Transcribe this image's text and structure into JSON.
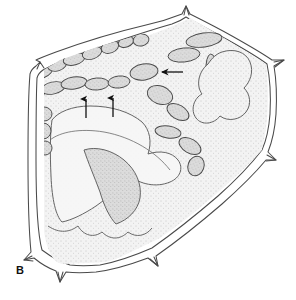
{
  "figure": {
    "panel_label": "B",
    "caption_text": "",
    "background_color": "#ffffff",
    "line_color": "#3a3a3a",
    "cytoplasm_fill": "#efefef",
    "cytoplasm_stipple_color": "#9a9a9a",
    "organelle_fill": "#d4d4d4",
    "organelle_stipple_color": "#8f8f8f",
    "organelle_outline": "#4a4a4a",
    "wall_outline": "#4a4a4a",
    "arrow_color": "#111111"
  },
  "structures": {
    "cell_wall": {
      "name": "cell-wall-outline",
      "style": "double-line",
      "spine_count": 8,
      "description": "Angular polygonal cell wall drawn as two parallel contour lines with sharp spine-like projections at each vertex"
    },
    "cytoplasm": {
      "name": "cytoplasm-region",
      "texture": "fine stipple"
    },
    "vacuole_lobe": {
      "name": "central-lobe",
      "description": "Large pale lobed region occupying lower-central portion of cell"
    }
  },
  "organelles": {
    "label": "chloroplasts",
    "count": 34,
    "fill": "#d4d4d4",
    "shapes": [
      {
        "id": "org-1",
        "cx": 28,
        "cy": 82,
        "rx": 9,
        "ry": 6,
        "rot": -28
      },
      {
        "id": "org-2",
        "cx": 42,
        "cy": 72,
        "rx": 11,
        "ry": 6,
        "rot": -22
      },
      {
        "id": "org-3",
        "cx": 57,
        "cy": 64,
        "rx": 10,
        "ry": 7,
        "rot": -18
      },
      {
        "id": "org-4",
        "cx": 74,
        "cy": 59,
        "rx": 11,
        "ry": 6,
        "rot": -14
      },
      {
        "id": "org-5",
        "cx": 92,
        "cy": 53,
        "rx": 10,
        "ry": 6,
        "rot": -20
      },
      {
        "id": "org-6",
        "cx": 110,
        "cy": 47,
        "rx": 9,
        "ry": 6,
        "rot": -20
      },
      {
        "id": "org-7",
        "cx": 126,
        "cy": 42,
        "rx": 8,
        "ry": 5,
        "rot": -20
      },
      {
        "id": "org-8",
        "cx": 141,
        "cy": 40,
        "rx": 8,
        "ry": 6,
        "rot": -10
      },
      {
        "id": "org-9",
        "cx": 34,
        "cy": 95,
        "rx": 10,
        "ry": 6,
        "rot": -10
      },
      {
        "id": "org-10",
        "cx": 53,
        "cy": 88,
        "rx": 12,
        "ry": 6,
        "rot": -12
      },
      {
        "id": "org-11",
        "cx": 74,
        "cy": 83,
        "rx": 13,
        "ry": 6,
        "rot": -8
      },
      {
        "id": "org-12",
        "cx": 97,
        "cy": 84,
        "rx": 12,
        "ry": 6,
        "rot": -4
      },
      {
        "id": "org-13",
        "cx": 119,
        "cy": 82,
        "rx": 11,
        "ry": 6,
        "rot": -6
      },
      {
        "id": "org-14",
        "cx": 44,
        "cy": 114,
        "rx": 8,
        "ry": 7,
        "rot": 0
      },
      {
        "id": "org-15",
        "cx": 43,
        "cy": 131,
        "rx": 8,
        "ry": 8,
        "rot": 0
      },
      {
        "id": "org-16",
        "cx": 45,
        "cy": 148,
        "rx": 7,
        "ry": 7,
        "rot": 0
      },
      {
        "id": "org-17",
        "cx": 144,
        "cy": 72,
        "rx": 14,
        "ry": 8,
        "rot": -8
      },
      {
        "id": "org-18",
        "cx": 160,
        "cy": 95,
        "rx": 13,
        "ry": 9,
        "rot": 20
      },
      {
        "id": "org-19",
        "cx": 178,
        "cy": 112,
        "rx": 12,
        "ry": 7,
        "rot": 30
      },
      {
        "id": "org-20",
        "cx": 168,
        "cy": 132,
        "rx": 13,
        "ry": 6,
        "rot": 8
      },
      {
        "id": "org-21",
        "cx": 190,
        "cy": 146,
        "rx": 12,
        "ry": 7,
        "rot": 30
      },
      {
        "id": "org-22",
        "cx": 196,
        "cy": 166,
        "rx": 8,
        "ry": 10,
        "rot": 20
      },
      {
        "id": "org-23",
        "cx": 212,
        "cy": 72,
        "rx": 6,
        "ry": 18,
        "rot": -4
      },
      {
        "id": "org-24",
        "cx": 213,
        "cy": 102,
        "rx": 6,
        "ry": 12,
        "rot": 0
      },
      {
        "id": "org-25",
        "cx": 184,
        "cy": 55,
        "rx": 16,
        "ry": 7,
        "rot": -6
      },
      {
        "id": "org-26",
        "cx": 204,
        "cy": 40,
        "rx": 18,
        "ry": 7,
        "rot": -8
      }
    ]
  },
  "annotations": {
    "arrows": [
      {
        "id": "arrow-left-up",
        "type": "arrow-up",
        "x": 86,
        "y_top": 97,
        "y_bottom": 118,
        "label": ""
      },
      {
        "id": "arrow-right-up",
        "type": "arrow-up",
        "x": 113,
        "y_top": 96,
        "y_bottom": 117,
        "label": ""
      },
      {
        "id": "arrow-pointing-left",
        "type": "arrow-left",
        "x_tip": 158,
        "x_tail": 183,
        "y": 72,
        "label": ""
      }
    ],
    "arrow_count": 3
  }
}
